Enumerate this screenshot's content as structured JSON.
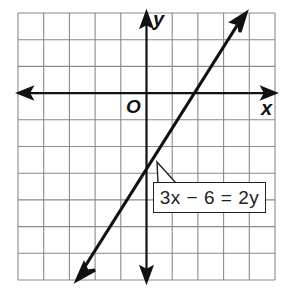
{
  "graph": {
    "grid": {
      "columns": 10,
      "rows": 10,
      "x_range": [
        -5,
        5
      ],
      "y_range": [
        -7,
        3
      ]
    },
    "axes": {
      "x_label": "x",
      "y_label": "y",
      "origin_label": "O"
    },
    "line": {
      "equation": "3x − 6 = 2y",
      "slope_intercept": "y = 1.5x − 3",
      "x_intercept": 2,
      "y_intercept": -3
    },
    "label": {
      "text": "3x − 6 = 2y",
      "pointer_to": [
        0.7,
        -2
      ]
    },
    "colors": {
      "grid": "#888888",
      "axes": "#111111",
      "line": "#111111",
      "background": "#ffffff"
    }
  }
}
